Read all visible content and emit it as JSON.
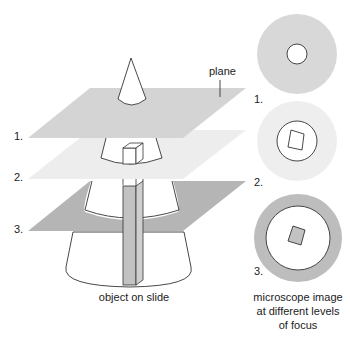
{
  "diagram": {
    "left": {
      "plane_label": "plane",
      "level_labels": [
        "1.",
        "2.",
        "3."
      ],
      "caption": "object on slide"
    },
    "right": {
      "level_labels": [
        "1.",
        "2.",
        "3."
      ],
      "caption_lines": [
        "microscope image",
        "at different levels",
        "of focus"
      ]
    },
    "colors": {
      "plane1": "#d4d4d4",
      "plane2": "#ececec",
      "plane3": "#b5b5b5",
      "column": "#c2c2c2",
      "view1_ring": "#d8d8d8",
      "view2_ring": "#eeeeee",
      "view3_ring": "#bdbdbd",
      "outline": "#333333"
    }
  }
}
